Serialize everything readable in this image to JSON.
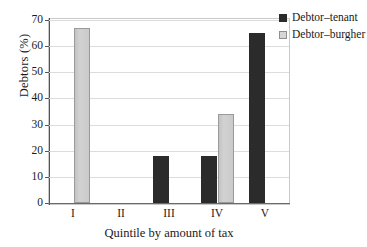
{
  "chart_data": {
    "type": "bar",
    "title": "",
    "xlabel": "Quintile by amount of tax",
    "ylabel": "Debtors (%)",
    "categories": [
      "I",
      "II",
      "III",
      "IV",
      "V"
    ],
    "series": [
      {
        "name": "Debtor–tenant",
        "color": "#2b2b2b",
        "values": [
          0,
          0,
          18,
          18,
          65
        ]
      },
      {
        "name": "Debtor–burgher",
        "color": "#d2d2d2",
        "values": [
          67,
          0,
          0,
          34,
          0
        ]
      }
    ],
    "ylim": [
      0,
      70
    ],
    "yticks": [
      0,
      10,
      20,
      30,
      40,
      50,
      60,
      70
    ],
    "ytick_labels": [
      "0",
      "10",
      "20",
      "30",
      "40",
      "50",
      "60",
      "70"
    ],
    "grid": "horizontal",
    "legend_position": "top-right-outside",
    "bar_group_mode": "grouped"
  }
}
